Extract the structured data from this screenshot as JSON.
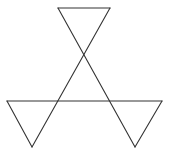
{
  "diagram": {
    "type": "geometric-figure",
    "stroke_color": "#333333",
    "background": "#ffffff",
    "vertices": {
      "top_left": [
        58,
        8
      ],
      "top_right": [
        110,
        8
      ],
      "left": [
        7,
        101
      ],
      "right": [
        162,
        101
      ],
      "bottom_left": [
        32,
        147
      ],
      "bottom_right": [
        135,
        147
      ]
    },
    "segments": [
      {
        "name": "top-edge",
        "from": [
          58,
          8
        ],
        "to": [
          110,
          8
        ]
      },
      {
        "name": "long-diagonal-right",
        "from": [
          58,
          8
        ],
        "to": [
          135,
          147
        ]
      },
      {
        "name": "long-diagonal-left",
        "from": [
          110,
          8
        ],
        "to": [
          32,
          147
        ]
      },
      {
        "name": "horizontal-base",
        "from": [
          7,
          101
        ],
        "to": [
          162,
          101
        ]
      },
      {
        "name": "left-triangle-edge",
        "from": [
          7,
          101
        ],
        "to": [
          32,
          147
        ]
      },
      {
        "name": "right-triangle-edge",
        "from": [
          162,
          101
        ],
        "to": [
          135,
          147
        ]
      }
    ]
  }
}
